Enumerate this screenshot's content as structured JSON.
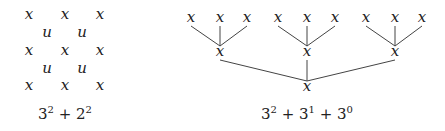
{
  "left": {
    "grid": [
      {
        "t": "x",
        "x": 29,
        "y": 16
      },
      {
        "t": "x",
        "x": 65,
        "y": 16
      },
      {
        "t": "x",
        "x": 100,
        "y": 16
      },
      {
        "t": "u",
        "x": 47,
        "y": 34
      },
      {
        "t": "u",
        "x": 82,
        "y": 34
      },
      {
        "t": "x",
        "x": 29,
        "y": 52
      },
      {
        "t": "x",
        "x": 65,
        "y": 52
      },
      {
        "t": "x",
        "x": 100,
        "y": 52
      },
      {
        "t": "u",
        "x": 47,
        "y": 70
      },
      {
        "t": "u",
        "x": 82,
        "y": 70
      },
      {
        "t": "x",
        "x": 29,
        "y": 87
      },
      {
        "t": "x",
        "x": 65,
        "y": 87
      },
      {
        "t": "x",
        "x": 100,
        "y": 87
      }
    ],
    "caption": {
      "b1": "3",
      "e1": "2",
      "op": " + ",
      "b2": "2",
      "e2": "2"
    }
  },
  "right": {
    "leaves": [
      {
        "x": 191,
        "y": 19
      },
      {
        "x": 220,
        "y": 19
      },
      {
        "x": 247,
        "y": 19
      },
      {
        "x": 278,
        "y": 19
      },
      {
        "x": 307,
        "y": 19
      },
      {
        "x": 335,
        "y": 19
      },
      {
        "x": 366,
        "y": 19
      },
      {
        "x": 395,
        "y": 19
      },
      {
        "x": 422,
        "y": 19
      }
    ],
    "parents": [
      {
        "x": 220,
        "y": 53
      },
      {
        "x": 307,
        "y": 53
      },
      {
        "x": 395,
        "y": 53
      }
    ],
    "root": {
      "x": 307,
      "y": 88
    },
    "label": "x",
    "caption": {
      "b1": "3",
      "e1": "2",
      "b2": "3",
      "e2": "1",
      "b3": "3",
      "e3": "0",
      "op": " + "
    }
  }
}
